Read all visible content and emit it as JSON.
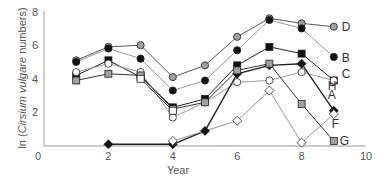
{
  "chart_data": {
    "type": "line",
    "title": "",
    "xlabel": "Year",
    "ylabel_prefix": "ln (",
    "ylabel_italic": "Cirsium vulgare",
    "ylabel_suffix": " numbers)",
    "xlim": [
      0,
      10
    ],
    "ylim": [
      0,
      8
    ],
    "xticks": [
      0,
      2,
      4,
      6,
      8,
      10
    ],
    "yticks": [
      2,
      4,
      6,
      8
    ],
    "grid": false,
    "legend_position": "inline-right",
    "x": [
      1,
      2,
      3,
      4,
      5,
      6,
      7,
      8,
      9
    ],
    "series": [
      {
        "name": "D",
        "marker": "circle",
        "fill": "#a0a0a0",
        "line": "#555555",
        "values": [
          5.1,
          5.9,
          6.0,
          4.1,
          4.8,
          6.5,
          7.6,
          7.3,
          7.1
        ]
      },
      {
        "name": "B",
        "marker": "circle",
        "fill": "#111111",
        "line": "#999999",
        "values": [
          5.0,
          5.8,
          5.2,
          3.3,
          3.9,
          5.7,
          7.5,
          7.0,
          5.3
        ]
      },
      {
        "name": "C",
        "marker": "square",
        "fill": "#111111",
        "line": "#222222",
        "values": [
          4.2,
          5.1,
          4.1,
          2.3,
          2.8,
          4.8,
          5.9,
          5.5,
          3.9
        ]
      },
      {
        "name": "H",
        "marker": "circle",
        "fill": "#ffffff",
        "line": "#999999",
        "values": [
          4.4,
          4.9,
          4.4,
          1.7,
          2.6,
          3.8,
          3.9,
          4.4,
          3.9
        ]
      },
      {
        "name": "A",
        "marker": "diamond",
        "fill": "#111111",
        "line": "#222222",
        "values": [
          null,
          0.1,
          null,
          0.1,
          0.9,
          4.3,
          4.8,
          4.9,
          2.1
        ]
      },
      {
        "name": "F",
        "marker": "diamond",
        "fill": "#ffffff",
        "line": "#999999",
        "values": [
          null,
          null,
          null,
          0.3,
          null,
          1.5,
          3.3,
          0.2,
          1.9
        ]
      },
      {
        "name": "G",
        "marker": "square",
        "fill": "#a0a0a0",
        "line": "#333333",
        "values": [
          3.9,
          4.3,
          4.2,
          2.2,
          2.6,
          4.5,
          4.9,
          2.5,
          0.3
        ]
      },
      {
        "name": "E",
        "marker": "square",
        "fill": "#ffffff",
        "line": "#333333",
        "values": [
          null,
          null,
          4.0,
          2.1,
          null,
          null,
          null,
          null,
          null
        ]
      }
    ],
    "series_labels": [
      "D",
      "B",
      "C",
      "H",
      "A",
      "F",
      "G"
    ]
  }
}
